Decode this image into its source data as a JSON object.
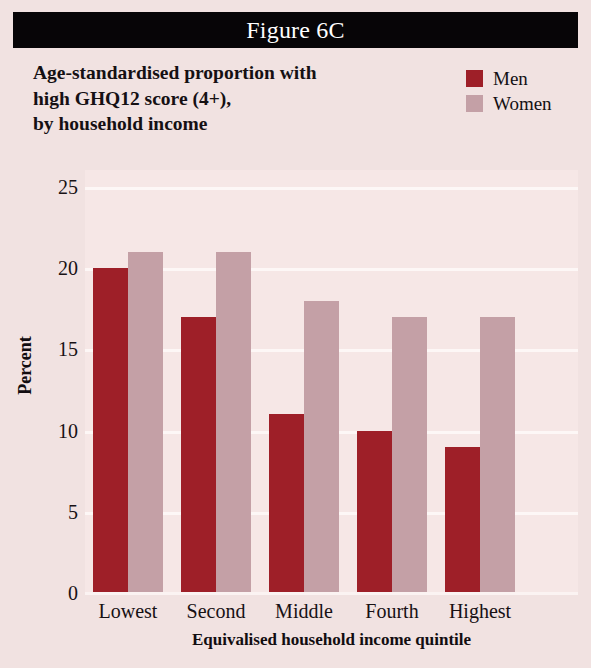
{
  "banner": {
    "figure_label": "Figure 6C"
  },
  "title": {
    "line1": "Age-standardised proportion with",
    "line2": "high GHQ12 score (4+),",
    "line3": "by household income"
  },
  "legend": {
    "position": "top-right",
    "entries": [
      {
        "label": "Men",
        "color": "#9e1f28"
      },
      {
        "label": "Women",
        "color": "#c4a0a6"
      }
    ]
  },
  "colors": {
    "page_background": "#f1e2e1",
    "plot_background": "#f6e7e6",
    "banner": "#070507",
    "banner_text": "#ffffff",
    "gridline": "#fdf7f6",
    "men": "#9e1f28",
    "women": "#c4a0a6"
  },
  "chart_data": {
    "type": "bar",
    "title": "Age-standardised proportion with high GHQ12 score (4+), by household income",
    "xlabel": "Equivalised household income quintile",
    "ylabel": "Percent",
    "categories": [
      "Lowest",
      "Second",
      "Middle",
      "Fourth",
      "Highest"
    ],
    "series": [
      {
        "name": "Men",
        "color": "#9e1f28",
        "values": [
          20,
          17,
          11,
          10,
          9
        ]
      },
      {
        "name": "Women",
        "color": "#c4a0a6",
        "values": [
          21,
          21,
          18,
          17,
          17
        ]
      }
    ],
    "ylim": [
      0,
      25
    ],
    "yticks": [
      0,
      5,
      10,
      15,
      20,
      25
    ],
    "ytick_labels": [
      "0",
      "5",
      "10",
      "15",
      "20",
      "25"
    ],
    "grid": true,
    "grid_axis": "y",
    "legend_position": "top-right"
  }
}
